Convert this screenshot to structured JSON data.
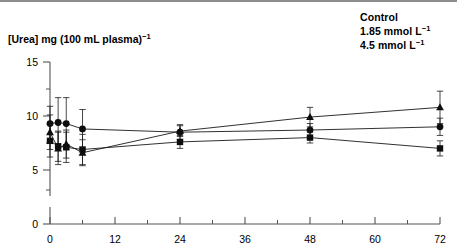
{
  "figure": {
    "ylabel_main": "[Urea] mg (100 mL plasma)",
    "ylabel_sup": "−1"
  },
  "legend": {
    "items": [
      {
        "label": "Control",
        "marker": "circle"
      },
      {
        "label": "1.85 mmol L",
        "sup": "−1",
        "marker": "square"
      },
      {
        "label": "4.5 mmol L",
        "sup": "−1",
        "marker": "triangle"
      }
    ]
  },
  "axes": {
    "y_ticks": [
      "15",
      "10",
      "5",
      "0"
    ],
    "x_ticks": [
      "0",
      "12",
      "24",
      "36",
      "48",
      "60",
      "72"
    ]
  },
  "chart_data": {
    "type": "line",
    "title": "",
    "xlabel": "",
    "ylabel": "[Urea] mg (100 mL plasma)⁻¹",
    "xlim": [
      0,
      72
    ],
    "ylim": [
      0,
      15
    ],
    "y_ticks": [
      0,
      5,
      10,
      15
    ],
    "y_minor_ticks": [
      2.5,
      7.5,
      12.5
    ],
    "x_ticks": [
      0,
      12,
      24,
      36,
      48,
      60,
      72
    ],
    "x_minor_ticks": [
      6,
      18,
      30,
      42,
      54,
      66
    ],
    "axis_break": true,
    "grid": false,
    "legend_position": "top-right",
    "errorbars": true,
    "series": [
      {
        "name": "Control",
        "marker": "circle",
        "x": [
          0,
          1.5,
          3,
          6,
          24,
          48,
          72
        ],
        "values": [
          9.3,
          9.4,
          9.3,
          8.8,
          8.5,
          8.7,
          9.0
        ],
        "err_lower": [
          1.6,
          2.3,
          2.4,
          1.8,
          0.7,
          0.6,
          0.8
        ],
        "err_upper": [
          1.6,
          2.3,
          2.4,
          1.8,
          0.7,
          0.6,
          0.8
        ]
      },
      {
        "name": "1.85 mmol L⁻¹",
        "marker": "square",
        "x": [
          0,
          1.5,
          3,
          6,
          24,
          48,
          72
        ],
        "values": [
          7.7,
          7.2,
          7.1,
          6.9,
          7.6,
          8.0,
          7.0
        ],
        "err_lower": [
          1.5,
          1.4,
          1.4,
          1.4,
          0.6,
          0.5,
          0.7
        ],
        "err_upper": [
          1.5,
          1.4,
          1.4,
          1.4,
          0.6,
          0.5,
          0.7
        ]
      },
      {
        "name": "4.5 mmol L⁻¹",
        "marker": "triangle",
        "x": [
          0,
          1.5,
          3,
          6,
          24,
          48,
          72
        ],
        "values": [
          8.5,
          7.0,
          7.4,
          6.6,
          8.6,
          9.9,
          10.8
        ],
        "err_lower": [
          1.6,
          1.5,
          1.3,
          1.2,
          0.5,
          0.9,
          1.5
        ],
        "err_upper": [
          1.6,
          1.5,
          1.3,
          1.2,
          0.5,
          0.9,
          1.5
        ]
      }
    ]
  }
}
